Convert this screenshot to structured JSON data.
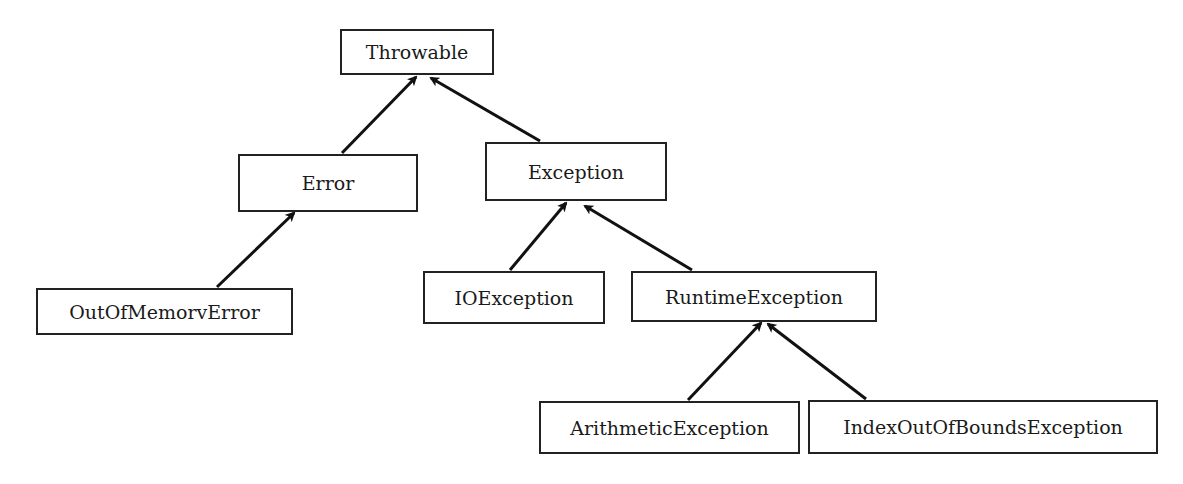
{
  "diagram": {
    "type": "class-hierarchy",
    "nodes": [
      {
        "id": "throwable",
        "label": "Throwable",
        "x": 340,
        "y": 29,
        "w": 154,
        "h": 46
      },
      {
        "id": "error",
        "label": "Error",
        "x": 238,
        "y": 154,
        "w": 180,
        "h": 58
      },
      {
        "id": "exception",
        "label": "Exception",
        "x": 485,
        "y": 142,
        "w": 182,
        "h": 59
      },
      {
        "id": "outofmemoryerror",
        "label": "OutOfMemorvError",
        "x": 36,
        "y": 288,
        "w": 257,
        "h": 47
      },
      {
        "id": "ioexception",
        "label": "IOException",
        "x": 423,
        "y": 271,
        "w": 182,
        "h": 53
      },
      {
        "id": "runtimeexception",
        "label": "RuntimeException",
        "x": 631,
        "y": 271,
        "w": 246,
        "h": 51
      },
      {
        "id": "arithmeticexception",
        "label": "ArithmeticException",
        "x": 539,
        "y": 401,
        "w": 261,
        "h": 53
      },
      {
        "id": "indexoutofboundsexception",
        "label": "IndexOutOfBoundsException",
        "x": 808,
        "y": 400,
        "w": 350,
        "h": 54
      }
    ],
    "edges": [
      {
        "from": "error",
        "to": "throwable",
        "x1": 342,
        "y1": 153,
        "x2": 416,
        "y2": 77
      },
      {
        "from": "exception",
        "to": "throwable",
        "x1": 540,
        "y1": 141,
        "x2": 431,
        "y2": 78
      },
      {
        "from": "outofmemoryerror",
        "to": "error",
        "x1": 217,
        "y1": 287,
        "x2": 294,
        "y2": 213
      },
      {
        "from": "ioexception",
        "to": "exception",
        "x1": 510,
        "y1": 270,
        "x2": 566,
        "y2": 203
      },
      {
        "from": "runtimeexception",
        "to": "exception",
        "x1": 692,
        "y1": 270,
        "x2": 585,
        "y2": 206
      },
      {
        "from": "arithmeticexception",
        "to": "runtimeexception",
        "x1": 688,
        "y1": 400,
        "x2": 761,
        "y2": 323
      },
      {
        "from": "indexoutofboundsexception",
        "to": "runtimeexception",
        "x1": 866,
        "y1": 399,
        "x2": 768,
        "y2": 324
      }
    ],
    "colors": {
      "stroke": "#111111",
      "background": "#ffffff",
      "text": "#1a1a1a"
    }
  }
}
